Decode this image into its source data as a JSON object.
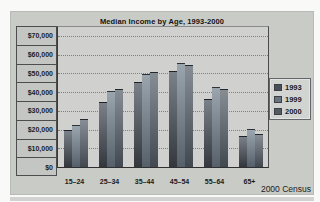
{
  "chart_data": {
    "type": "bar",
    "title": "Median Income by Age, 1993-2000",
    "categories": [
      "15–24",
      "25–34",
      "35–44",
      "45–54",
      "55–64",
      "65+"
    ],
    "series": [
      {
        "name": "1993",
        "values": [
          19000,
          34000,
          45000,
          51000,
          36000,
          16000
        ],
        "color_top": "#7b8189",
        "color_bottom": "#33373d",
        "legend_color": "#4a4f56"
      },
      {
        "name": "1999",
        "values": [
          22000,
          40000,
          49000,
          55000,
          42000,
          20000
        ],
        "color_top": "#9aa5ae",
        "color_bottom": "#55606a",
        "legend_color": "#69747e"
      },
      {
        "name": "2000",
        "values": [
          25000,
          41000,
          50000,
          54000,
          41000,
          17000
        ],
        "color_top": "#878d95",
        "color_bottom": "#42484f",
        "legend_color": "#545a62"
      }
    ],
    "y_ticks": [
      "$70,000",
      "$60,000",
      "$50,000",
      "$40,000",
      "$30,000",
      "$20,000",
      "$10,000",
      "$0"
    ],
    "ylim": [
      0,
      70000
    ],
    "grid": true,
    "legend_position": "right",
    "annotation": "2000 Census"
  },
  "colors": {
    "chart_background": "#c9cbc7",
    "plot_background": "#d0d1ce",
    "axis_column_background": "#c4c6c3",
    "gridline": "#818181",
    "text": "#1c1c1c"
  }
}
